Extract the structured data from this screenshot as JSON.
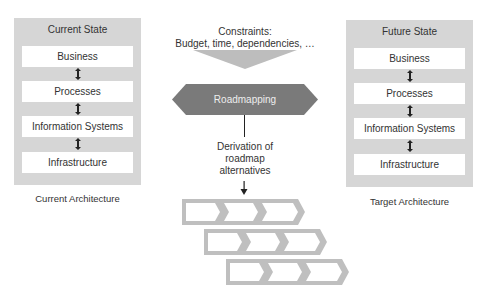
{
  "left_panel": {
    "title": "Current State",
    "layers": [
      "Business",
      "Processes",
      "Information Systems",
      "Infrastructure"
    ],
    "caption": "Current Architecture"
  },
  "right_panel": {
    "title": "Future State",
    "layers": [
      "Business",
      "Processes",
      "Information Systems",
      "Infrastructure"
    ],
    "caption": "Target Architecture"
  },
  "constraints": {
    "line1": "Constraints:",
    "line2": "Budget, time, dependencies, …"
  },
  "roadmapping": {
    "label": "Roadmapping"
  },
  "derivation": {
    "line1": "Derivation of",
    "line2": "roadmap",
    "line3": "alternatives"
  },
  "alternatives": {
    "rows": 3,
    "steps_per_row": 3
  },
  "colors": {
    "panel_bg": "#d6d6d6",
    "layer_bg": "#ffffff",
    "funnel": "#bdbdbd",
    "roadmapping_hex": "#7a7a7a",
    "chevron_border": "#bfbfbf",
    "text": "#333333"
  }
}
